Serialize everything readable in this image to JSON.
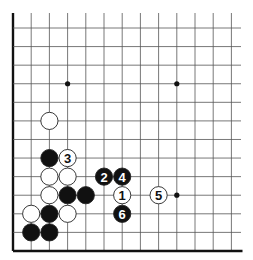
{
  "diagram": {
    "type": "go-board-fragment",
    "edges": [
      "left",
      "bottom"
    ],
    "columns": 13,
    "rows": 13,
    "star_points": [
      {
        "col": 3,
        "row": 3
      },
      {
        "col": 9,
        "row": 3
      },
      {
        "col": 9,
        "row": 9
      }
    ],
    "stones": [
      {
        "color": "white",
        "col": 2,
        "row": 5,
        "label": ""
      },
      {
        "color": "black",
        "col": 2,
        "row": 7,
        "label": ""
      },
      {
        "color": "white",
        "col": 3,
        "row": 7,
        "label": "3"
      },
      {
        "color": "white",
        "col": 2,
        "row": 8,
        "label": ""
      },
      {
        "color": "white",
        "col": 3,
        "row": 8,
        "label": ""
      },
      {
        "color": "black",
        "col": 5,
        "row": 8,
        "label": "2"
      },
      {
        "color": "black",
        "col": 6,
        "row": 8,
        "label": "4"
      },
      {
        "color": "white",
        "col": 2,
        "row": 9,
        "label": ""
      },
      {
        "color": "black",
        "col": 3,
        "row": 9,
        "label": ""
      },
      {
        "color": "black",
        "col": 4,
        "row": 9,
        "label": ""
      },
      {
        "color": "white",
        "col": 6,
        "row": 9,
        "label": "1"
      },
      {
        "color": "white",
        "col": 8,
        "row": 9,
        "label": "5"
      },
      {
        "color": "white",
        "col": 1,
        "row": 10,
        "label": ""
      },
      {
        "color": "black",
        "col": 2,
        "row": 10,
        "label": ""
      },
      {
        "color": "white",
        "col": 3,
        "row": 10,
        "label": ""
      },
      {
        "color": "black",
        "col": 6,
        "row": 10,
        "label": "6"
      },
      {
        "color": "black",
        "col": 1,
        "row": 11,
        "label": ""
      },
      {
        "color": "black",
        "col": 2,
        "row": 11,
        "label": ""
      }
    ],
    "colors": {
      "line": "#555555",
      "edge": "#111111",
      "black_stone": "#111111",
      "white_stone": "#ffffff",
      "stone_outline": "#222222"
    }
  }
}
